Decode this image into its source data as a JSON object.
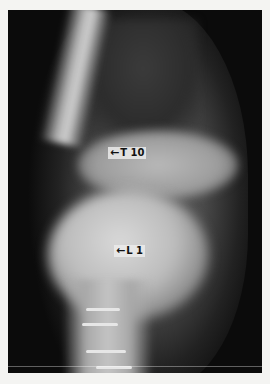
{
  "image": {
    "description": "Lateral-oblique radiograph of the thoracolumbar spine",
    "labels": [
      {
        "text": "T 10",
        "arrow": "left-arrow"
      },
      {
        "text": "L 1",
        "arrow": "left-arrow"
      }
    ]
  },
  "colors": {
    "page_background": "#f4f4f2",
    "film_background": "#0b0b0b"
  }
}
